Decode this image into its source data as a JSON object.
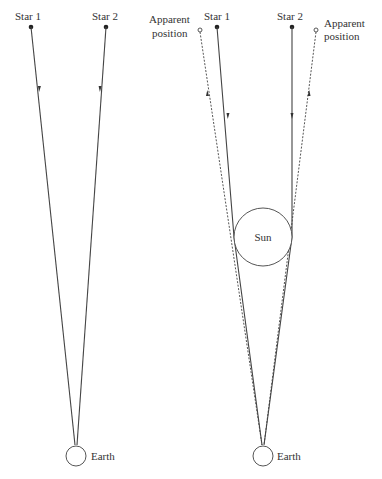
{
  "diagram": {
    "left_panel": {
      "star1_label": "Star 1",
      "star2_label": "Star 2",
      "earth_label": "Earth"
    },
    "right_panel": {
      "star1_label": "Star 1",
      "star2_label": "Star 2",
      "apparent_left_line1": "Apparent",
      "apparent_left_line2": "position",
      "apparent_right_line1": "Apparent",
      "apparent_right_line2": "position",
      "sun_label": "Sun",
      "earth_label": "Earth"
    }
  }
}
